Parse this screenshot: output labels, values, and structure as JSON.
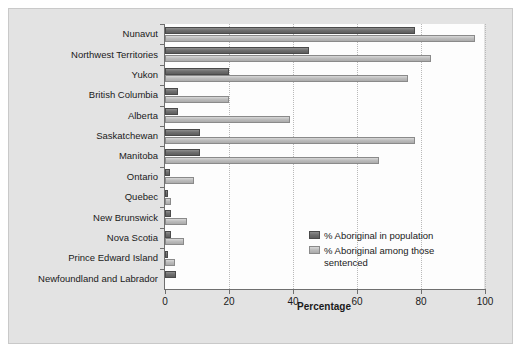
{
  "chart_data": {
    "type": "bar",
    "orientation": "horizontal",
    "title": "",
    "xlabel": "Percentage",
    "ylabel": "",
    "xlim": [
      0,
      100
    ],
    "xticks": [
      0,
      20,
      40,
      60,
      80,
      100
    ],
    "grid": true,
    "grid_axis": "x",
    "legend_position": "center-right-inside",
    "categories": [
      "Nunavut",
      "Northwest Territories",
      "Yukon",
      "British Columbia",
      "Alberta",
      "Saskatchewan",
      "Manitoba",
      "Ontario",
      "Quebec",
      "New Brunswick",
      "Nova Scotia",
      "Prince Edward Island",
      "Newfoundland and Labrador"
    ],
    "series": [
      {
        "name": "% Aboriginal in population",
        "color": "#6f6f6f",
        "values": [
          78,
          45,
          20,
          4,
          4,
          11,
          11,
          1.5,
          1,
          2,
          2,
          1,
          3.5
        ]
      },
      {
        "name": "% Aboriginal among those sentenced",
        "color": "#bdbdbd",
        "values": [
          97,
          83,
          76,
          20,
          39,
          78,
          67,
          9,
          2,
          7,
          6,
          3,
          0
        ]
      }
    ]
  },
  "legend": {
    "entries": [
      "% Aboriginal in population",
      "% Aboriginal among those sentenced"
    ]
  },
  "axis": {
    "x_title": "Percentage",
    "tick_labels": [
      "0",
      "20",
      "40",
      "60",
      "80",
      "100"
    ]
  }
}
